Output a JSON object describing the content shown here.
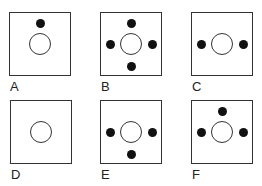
{
  "figure": {
    "type": "option-grid",
    "panels": [
      {
        "label": "A",
        "dots": [
          "top"
        ]
      },
      {
        "label": "B",
        "dots": [
          "top",
          "left",
          "right",
          "bottom"
        ]
      },
      {
        "label": "C",
        "dots": [
          "left",
          "right"
        ]
      },
      {
        "label": "D",
        "dots": []
      },
      {
        "label": "E",
        "dots": [
          "left",
          "right",
          "bottom"
        ]
      },
      {
        "label": "F",
        "dots": [
          "top",
          "left",
          "right"
        ]
      }
    ],
    "colors": {
      "stroke": "#333333",
      "dot": "#111111",
      "background": "#ffffff"
    }
  }
}
